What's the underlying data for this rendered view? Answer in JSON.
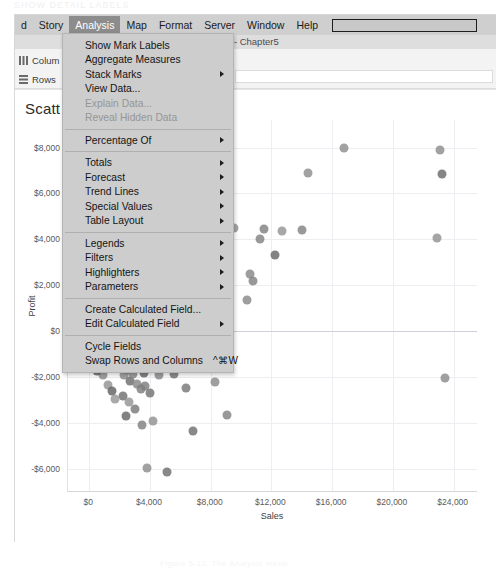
{
  "artifacts": {
    "top_text": "SHOW  DETAIL  LABELS",
    "bottom_text": "Figure 5-12. The Analysis menu"
  },
  "menubar": {
    "items": [
      {
        "label": "d",
        "active": false
      },
      {
        "label": "Story",
        "active": false
      },
      {
        "label": "Analysis",
        "active": true
      },
      {
        "label": "Map",
        "active": false
      },
      {
        "label": "Format",
        "active": false
      },
      {
        "label": "Server",
        "active": false
      },
      {
        "label": "Window",
        "active": false
      },
      {
        "label": "Help",
        "active": false
      }
    ],
    "search_value": ""
  },
  "document_title": "bleau - Chapter5",
  "shelves": {
    "columns_label": "Colum",
    "rows_label": "Rows"
  },
  "worksheet": {
    "title": "Scatt"
  },
  "analysis_menu": {
    "groups": [
      {
        "items": [
          {
            "label": "Show Mark Labels",
            "submenu": false,
            "disabled": false,
            "shortcut": ""
          },
          {
            "label": "Aggregate Measures",
            "submenu": false,
            "disabled": false,
            "shortcut": ""
          },
          {
            "label": "Stack Marks",
            "submenu": true,
            "disabled": false,
            "shortcut": ""
          },
          {
            "label": "View Data...",
            "submenu": false,
            "disabled": false,
            "shortcut": ""
          },
          {
            "label": "Explain Data...",
            "submenu": false,
            "disabled": true,
            "shortcut": ""
          },
          {
            "label": "Reveal Hidden Data",
            "submenu": false,
            "disabled": true,
            "shortcut": ""
          }
        ]
      },
      {
        "items": [
          {
            "label": "Percentage Of",
            "submenu": true,
            "disabled": false,
            "shortcut": ""
          }
        ]
      },
      {
        "items": [
          {
            "label": "Totals",
            "submenu": true,
            "disabled": false,
            "shortcut": ""
          },
          {
            "label": "Forecast",
            "submenu": true,
            "disabled": false,
            "shortcut": ""
          },
          {
            "label": "Trend Lines",
            "submenu": true,
            "disabled": false,
            "shortcut": ""
          },
          {
            "label": "Special Values",
            "submenu": true,
            "disabled": false,
            "shortcut": ""
          },
          {
            "label": "Table Layout",
            "submenu": true,
            "disabled": false,
            "shortcut": ""
          }
        ]
      },
      {
        "items": [
          {
            "label": "Legends",
            "submenu": true,
            "disabled": false,
            "shortcut": ""
          },
          {
            "label": "Filters",
            "submenu": true,
            "disabled": false,
            "shortcut": ""
          },
          {
            "label": "Highlighters",
            "submenu": true,
            "disabled": false,
            "shortcut": ""
          },
          {
            "label": "Parameters",
            "submenu": true,
            "disabled": false,
            "shortcut": ""
          }
        ]
      },
      {
        "items": [
          {
            "label": "Create Calculated Field...",
            "submenu": false,
            "disabled": false,
            "shortcut": ""
          },
          {
            "label": "Edit Calculated Field",
            "submenu": true,
            "disabled": false,
            "shortcut": ""
          }
        ]
      },
      {
        "items": [
          {
            "label": "Cycle Fields",
            "submenu": false,
            "disabled": false,
            "shortcut": ""
          },
          {
            "label": "Swap Rows and Columns",
            "submenu": false,
            "disabled": false,
            "shortcut": "^⌘W"
          }
        ]
      }
    ]
  },
  "chart_data": {
    "type": "scatter",
    "title": "Scatt",
    "xlabel": "Sales",
    "ylabel": "Profit",
    "xlim": [
      -1400,
      25600
    ],
    "ylim": [
      -7000,
      9200
    ],
    "xticks": [
      0,
      4000,
      8000,
      12000,
      16000,
      20000,
      24000
    ],
    "xticklabels": [
      "$0",
      "$4,000",
      "$8,000",
      "$12,000",
      "$16,000",
      "$20,000",
      "$24,000"
    ],
    "yticks": [
      8000,
      6000,
      4000,
      2000,
      0,
      -2000,
      -4000,
      -6000
    ],
    "yticklabels": [
      "$8,000",
      "$6,000",
      "$4,000",
      "$2,000",
      "$0",
      "-$2,000",
      "-$4,000",
      "-$6,000"
    ],
    "grid": true,
    "legend": false,
    "mark_color": "#6e6e6e",
    "points": [
      [
        16800,
        8000
      ],
      [
        14400,
        6900
      ],
      [
        14000,
        4400
      ],
      [
        12700,
        4350
      ],
      [
        11500,
        4450
      ],
      [
        11250,
        4000
      ],
      [
        12200,
        3300
      ],
      [
        10600,
        2500
      ],
      [
        10750,
        2200
      ],
      [
        10400,
        1350
      ],
      [
        9500,
        4500
      ],
      [
        8900,
        3100
      ],
      [
        9100,
        1800
      ],
      [
        8300,
        2400
      ],
      [
        8050,
        1000
      ],
      [
        7700,
        1750
      ],
      [
        7300,
        900
      ],
      [
        6900,
        1600
      ],
      [
        6500,
        600
      ],
      [
        6200,
        1300
      ],
      [
        5900,
        200
      ],
      [
        5500,
        1050
      ],
      [
        5200,
        450
      ],
      [
        4900,
        900
      ],
      [
        4650,
        100
      ],
      [
        4400,
        700
      ],
      [
        4150,
        300
      ],
      [
        3900,
        850
      ],
      [
        3700,
        150
      ],
      [
        3500,
        550
      ],
      [
        3300,
        -50
      ],
      [
        3100,
        400
      ],
      [
        2950,
        150
      ],
      [
        2800,
        650
      ],
      [
        2650,
        -100
      ],
      [
        2500,
        300
      ],
      [
        2380,
        50
      ],
      [
        2250,
        500
      ],
      [
        2150,
        -150
      ],
      [
        2050,
        200
      ],
      [
        1950,
        -30
      ],
      [
        1870,
        380
      ],
      [
        1790,
        -200
      ],
      [
        1710,
        120
      ],
      [
        1640,
        -80
      ],
      [
        1570,
        300
      ],
      [
        1500,
        -250
      ],
      [
        1440,
        60
      ],
      [
        1380,
        -120
      ],
      [
        1320,
        240
      ],
      [
        1260,
        -300
      ],
      [
        1210,
        30
      ],
      [
        1160,
        -160
      ],
      [
        1110,
        190
      ],
      [
        1060,
        -340
      ],
      [
        1020,
        10
      ],
      [
        975,
        -190
      ],
      [
        930,
        150
      ],
      [
        890,
        -380
      ],
      [
        850,
        -20
      ],
      [
        815,
        -220
      ],
      [
        780,
        110
      ],
      [
        745,
        -420
      ],
      [
        715,
        -50
      ],
      [
        685,
        -250
      ],
      [
        655,
        80
      ],
      [
        625,
        -460
      ],
      [
        600,
        -70
      ],
      [
        575,
        -270
      ],
      [
        550,
        60
      ],
      [
        525,
        -500
      ],
      [
        500,
        -90
      ],
      [
        480,
        -290
      ],
      [
        460,
        40
      ],
      [
        440,
        -530
      ],
      [
        420,
        -110
      ],
      [
        400,
        -310
      ],
      [
        385,
        20
      ],
      [
        370,
        -560
      ],
      [
        355,
        -130
      ],
      [
        340,
        -330
      ],
      [
        325,
        5
      ],
      [
        310,
        -590
      ],
      [
        300,
        -150
      ],
      [
        290,
        -350
      ],
      [
        280,
        -10
      ],
      [
        270,
        -620
      ],
      [
        260,
        -170
      ],
      [
        250,
        -370
      ],
      [
        240,
        -25
      ],
      [
        230,
        -650
      ],
      [
        225,
        -190
      ],
      [
        215,
        -390
      ],
      [
        205,
        -40
      ],
      [
        200,
        -680
      ],
      [
        190,
        -210
      ],
      [
        185,
        -410
      ],
      [
        175,
        -55
      ],
      [
        170,
        -710
      ],
      [
        160,
        -230
      ],
      [
        155,
        -430
      ],
      [
        150,
        -70
      ],
      [
        145,
        -740
      ],
      [
        140,
        -250
      ],
      [
        135,
        -450
      ],
      [
        130,
        -85
      ],
      [
        125,
        -770
      ],
      [
        120,
        -270
      ],
      [
        115,
        -470
      ],
      [
        110,
        -100
      ],
      [
        105,
        -800
      ],
      [
        100,
        -290
      ],
      [
        1100,
        -900
      ],
      [
        1350,
        -1050
      ],
      [
        1600,
        -800
      ],
      [
        1750,
        -1250
      ],
      [
        1900,
        -1600
      ],
      [
        2100,
        -1450
      ],
      [
        2300,
        -1900
      ],
      [
        2500,
        -1700
      ],
      [
        2700,
        -2150
      ],
      [
        2900,
        -1850
      ],
      [
        3150,
        -2300
      ],
      [
        3400,
        -2500
      ],
      [
        3700,
        -2400
      ],
      [
        4000,
        -2700
      ],
      [
        2200,
        -2800
      ],
      [
        2600,
        -3100
      ],
      [
        3000,
        -3400
      ],
      [
        2400,
        -3700
      ],
      [
        3500,
        -4100
      ],
      [
        4200,
        -3900
      ],
      [
        5600,
        -1850
      ],
      [
        6400,
        -2450
      ],
      [
        7200,
        -1500
      ],
      [
        8300,
        -2200
      ],
      [
        9100,
        -3650
      ],
      [
        6800,
        -4350
      ],
      [
        5100,
        -6150
      ],
      [
        23400,
        -2050
      ],
      [
        22900,
        4050
      ],
      [
        23200,
        6850
      ],
      [
        23100,
        7900
      ],
      [
        3800,
        -5950
      ],
      [
        900,
        -1900
      ],
      [
        1250,
        -2350
      ],
      [
        1500,
        -2600
      ],
      [
        1700,
        -2950
      ],
      [
        2000,
        -1150
      ],
      [
        2400,
        -1300
      ],
      [
        2800,
        -1000
      ],
      [
        3200,
        -1550
      ],
      [
        3600,
        -1800
      ],
      [
        4100,
        -1400
      ],
      [
        4600,
        -1900
      ],
      [
        5000,
        -1200
      ],
      [
        600,
        -1100
      ],
      [
        750,
        -1450
      ],
      [
        480,
        -1750
      ],
      [
        350,
        -1350
      ],
      [
        1300,
        -650
      ],
      [
        1550,
        -480
      ],
      [
        1800,
        -420
      ],
      [
        2050,
        -700
      ],
      [
        2350,
        -520
      ],
      [
        2700,
        -620
      ],
      [
        3050,
        -760
      ],
      [
        3400,
        -560
      ]
    ]
  }
}
